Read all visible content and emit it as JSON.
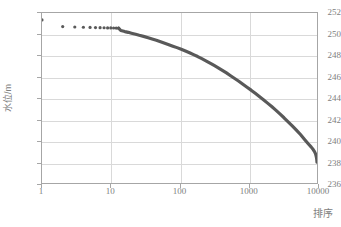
{
  "chart_data": {
    "type": "scatter",
    "title": "",
    "xlabel": "排序",
    "ylabel": "水位/m",
    "xscale": "log",
    "xlim": [
      1,
      10000
    ],
    "ylim": [
      236,
      252
    ],
    "grid": true,
    "legend": "none",
    "marker_color": "#595959",
    "gridline_color": "#d9d9d9",
    "axis_color": "#a6a6a6",
    "tick_text_color": "#808080",
    "xticks": [
      1,
      10,
      100,
      1000,
      10000
    ],
    "xtick_labels": [
      "1",
      "10",
      "100",
      "1000",
      "10000"
    ],
    "yticks": [
      236,
      238,
      240,
      242,
      244,
      246,
      248,
      250,
      252
    ],
    "ytick_labels": [
      "236",
      "238",
      "240",
      "242",
      "244",
      "246",
      "248",
      "250",
      "252"
    ],
    "series": [
      {
        "name": "水位历时曲线",
        "x": [
          1,
          2,
          3,
          4,
          5,
          6,
          7,
          8,
          9,
          10,
          11,
          12,
          13,
          14,
          15,
          16,
          18,
          20,
          23,
          26,
          30,
          35,
          40,
          46,
          53,
          61,
          70,
          80,
          92,
          106,
          122,
          140,
          160,
          184,
          211,
          242,
          278,
          319,
          366,
          420,
          482,
          553,
          635,
          729,
          836,
          960,
          1101,
          1264,
          1450,
          1664,
          1910,
          2192,
          2516,
          2888,
          3314,
          3804,
          4366,
          5011,
          5751,
          6600,
          7400,
          8200,
          8800,
          9200,
          9500,
          9700,
          9850,
          9950,
          10000
        ],
        "y": [
          251.35,
          250.72,
          250.68,
          250.66,
          250.64,
          250.63,
          250.62,
          250.61,
          250.6,
          250.6,
          250.59,
          250.58,
          250.57,
          250.35,
          250.3,
          250.25,
          250.18,
          250.1,
          250.0,
          249.9,
          249.8,
          249.68,
          249.56,
          249.44,
          249.3,
          249.16,
          249.02,
          248.88,
          248.74,
          248.58,
          248.42,
          248.26,
          248.08,
          247.9,
          247.7,
          247.5,
          247.28,
          247.06,
          246.84,
          246.6,
          246.36,
          246.1,
          245.84,
          245.58,
          245.3,
          245.02,
          244.74,
          244.44,
          244.14,
          243.84,
          243.52,
          243.2,
          242.86,
          242.5,
          242.14,
          241.76,
          241.38,
          240.98,
          240.56,
          240.1,
          239.72,
          239.4,
          239.15,
          238.96,
          238.76,
          238.56,
          238.36,
          238.1,
          237.95
        ]
      }
    ]
  }
}
